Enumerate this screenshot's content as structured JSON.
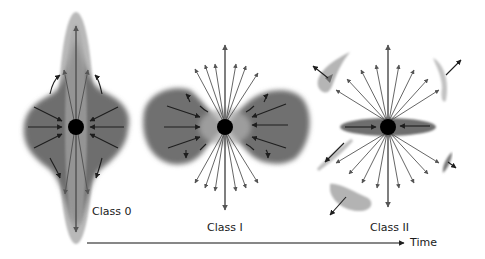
{
  "diagram": {
    "stages": [
      {
        "id": "class0",
        "label": "Class 0",
        "description": "Dense infalling envelope with strong bipolar outflow"
      },
      {
        "id": "class1",
        "label": "Class I",
        "description": "Envelope with cleared outflow cavities, infall onto star"
      },
      {
        "id": "class2",
        "label": "Class II",
        "description": "Star with accretion disk, dispersing envelope remnants, wide outflow"
      }
    ],
    "axis": {
      "label": "Time",
      "direction": "left-to-right"
    },
    "colors": {
      "envelope_dark": "#6e6e6e",
      "envelope_light": "#b8b8b8",
      "star": "#000000",
      "infall_arrow": "#1e1e1e",
      "outflow_arrow": "#555555",
      "axis": "#111111"
    }
  }
}
